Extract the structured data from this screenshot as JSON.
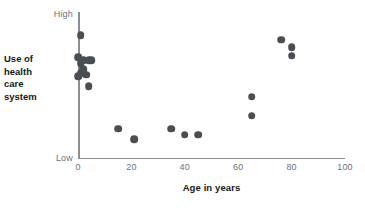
{
  "chart_data": {
    "type": "scatter",
    "title": "",
    "xlabel": "Age in years",
    "ylabel": "Use of health care system",
    "ylabel_lines": [
      "Use of",
      "health",
      "care",
      "system"
    ],
    "xlim": [
      0,
      100
    ],
    "ylim": [
      0,
      100
    ],
    "xticks": [
      0,
      20,
      40,
      60,
      80,
      100
    ],
    "xtick_labels": [
      "0",
      "20",
      "40",
      "60",
      "80",
      "100"
    ],
    "ytick_labels": [
      "High",
      "Low"
    ],
    "y_high_label": "High",
    "y_low_label": "Low",
    "grid": false,
    "legend": null,
    "marker_color": "#4a4e52",
    "axis_color": "#8a8f94",
    "points": [
      {
        "x": 1,
        "y": 84
      },
      {
        "x": 0,
        "y": 69
      },
      {
        "x": 1,
        "y": 65
      },
      {
        "x": 2,
        "y": 67
      },
      {
        "x": 4,
        "y": 67
      },
      {
        "x": 5,
        "y": 67
      },
      {
        "x": 2,
        "y": 61
      },
      {
        "x": 1,
        "y": 58
      },
      {
        "x": 3,
        "y": 57
      },
      {
        "x": 0,
        "y": 56
      },
      {
        "x": 4,
        "y": 49
      },
      {
        "x": 15,
        "y": 20
      },
      {
        "x": 21,
        "y": 13
      },
      {
        "x": 35,
        "y": 20
      },
      {
        "x": 40,
        "y": 16
      },
      {
        "x": 45,
        "y": 16
      },
      {
        "x": 65,
        "y": 42
      },
      {
        "x": 65,
        "y": 29
      },
      {
        "x": 76,
        "y": 81
      },
      {
        "x": 80,
        "y": 76
      },
      {
        "x": 80,
        "y": 70
      }
    ]
  }
}
